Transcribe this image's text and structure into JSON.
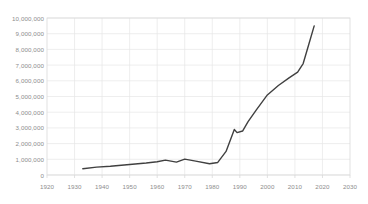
{
  "chart_data": {
    "type": "line",
    "title": "",
    "subtitle": "",
    "xlabel": "",
    "ylabel": "",
    "xlim": [
      1920,
      2030
    ],
    "ylim": [
      0,
      10000000
    ],
    "grid": true,
    "legend": null,
    "legend_position": "none",
    "xticks": [
      1920,
      1930,
      1940,
      1950,
      1960,
      1970,
      1980,
      1990,
      2000,
      2010,
      2020,
      2030
    ],
    "xtick_labels": [
      "1920",
      "1930",
      "1940",
      "1950",
      "1960",
      "1970",
      "1980",
      "1990",
      "2000",
      "2010",
      "2020",
      "2030"
    ],
    "yticks": [
      0,
      1000000,
      2000000,
      3000000,
      4000000,
      5000000,
      6000000,
      7000000,
      8000000,
      9000000,
      10000000
    ],
    "ytick_labels": [
      "0",
      "1,000,000",
      "2,000,000",
      "3,000,000",
      "4,000,000",
      "5,000,000",
      "6,000,000",
      "7,000,000",
      "8,000,000",
      "9,000,000",
      "10,000,000"
    ],
    "series": [
      {
        "name": "series-1",
        "color": "#404040",
        "line_width": 1.4,
        "markers": false,
        "x": [
          1933,
          1938,
          1943,
          1948,
          1952,
          1956,
          1960,
          1963,
          1967,
          1970,
          1974,
          1979,
          1982,
          1985,
          1988,
          1989,
          1991,
          1993,
          1996,
          2000,
          2004,
          2008,
          2011,
          2013,
          2015,
          2017
        ],
        "y": [
          400000,
          500000,
          560000,
          640000,
          700000,
          760000,
          840000,
          950000,
          820000,
          1010000,
          880000,
          720000,
          800000,
          1500000,
          2900000,
          2700000,
          2800000,
          3400000,
          4150000,
          5100000,
          5700000,
          6200000,
          6550000,
          7100000,
          8300000,
          9500000
        ]
      }
    ]
  },
  "axes": {
    "plot_left_px": 47,
    "plot_right_px": 350,
    "plot_top_px": 18,
    "plot_bottom_px": 175,
    "grid_color": "#e6e6e6",
    "frame_color": "#d9d9d9",
    "tick_text_color": "#8d8d8d"
  }
}
